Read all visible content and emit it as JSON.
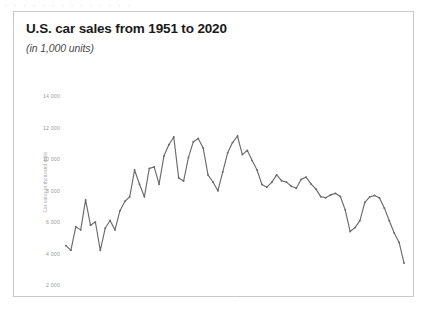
{
  "top_strip": {
    "text": "· · ·  ·  ·  ·   ·  ·   ·  ·  ·   ·  ·  ·"
  },
  "card": {
    "title": "U.S. car sales from 1951 to 2020",
    "subtitle": "(in 1,000 units)"
  },
  "chart_data": {
    "type": "line",
    "title": "U.S. car sales from 1951 to 2020",
    "subtitle": "(in 1,000 units)",
    "xlabel": "",
    "ylabel": "Car sales in thousand units",
    "ylim": [
      2000,
      14000
    ],
    "ytick_values": [
      2000,
      4000,
      6000,
      8000,
      10000,
      12000,
      14000
    ],
    "ytick_labels": [
      "2 000",
      "4 000",
      "6 000",
      "8 000",
      "10 000",
      "12 000",
      "14 000"
    ],
    "xtick_labels": [
      "1951",
      "1954",
      "1957",
      "1960",
      "1963",
      "1966",
      "1969",
      "1972",
      "1975",
      "1978",
      "1981",
      "1984",
      "1987",
      "1990",
      "1993",
      "1996",
      "1999",
      "2002",
      "2005",
      "2008",
      "2011",
      "2014",
      "2017",
      "2020"
    ],
    "xtick_step": 3,
    "grid": false,
    "legend": "none",
    "line_color": "#6b6b6b",
    "marker": "circle",
    "x": [
      1951,
      1952,
      1953,
      1954,
      1955,
      1956,
      1957,
      1958,
      1959,
      1960,
      1961,
      1962,
      1963,
      1964,
      1965,
      1966,
      1967,
      1968,
      1969,
      1970,
      1971,
      1972,
      1973,
      1974,
      1975,
      1976,
      1977,
      1978,
      1979,
      1980,
      1981,
      1982,
      1983,
      1984,
      1985,
      1986,
      1987,
      1988,
      1989,
      1990,
      1991,
      1992,
      1993,
      1994,
      1995,
      1996,
      1997,
      1998,
      1999,
      2000,
      2001,
      2002,
      2003,
      2004,
      2005,
      2006,
      2007,
      2008,
      2009,
      2010,
      2011,
      2012,
      2013,
      2014,
      2015,
      2016,
      2017,
      2018,
      2019,
      2020
    ],
    "values": [
      4500,
      4200,
      5700,
      5500,
      7400,
      5800,
      6000,
      4200,
      5600,
      6100,
      5500,
      6700,
      7300,
      7600,
      9300,
      8400,
      7600,
      9400,
      9500,
      8400,
      10200,
      10900,
      11400,
      8800,
      8600,
      10100,
      11100,
      11300,
      10700,
      8980,
      8540,
      7980,
      9180,
      10390,
      11040,
      11460,
      10280,
      10550,
      9900,
      9300,
      8380,
      8210,
      8520,
      8990,
      8620,
      8530,
      8270,
      8140,
      8700,
      8850,
      8420,
      8100,
      7610,
      7540,
      7720,
      7820,
      7620,
      6770,
      5400,
      5640,
      6090,
      7240,
      7590,
      7690,
      7520,
      6880,
      6080,
      5300,
      4700,
      3400
    ]
  }
}
